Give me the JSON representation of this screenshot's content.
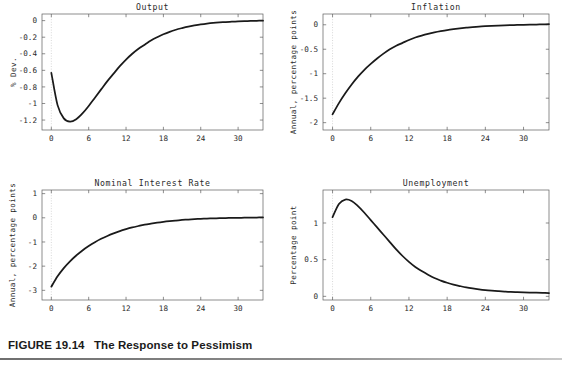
{
  "figure": {
    "caption_number": "FIGURE 19.14",
    "caption_title": "The Response to Pessimism"
  },
  "chart_data": [
    {
      "type": "line",
      "panel_id": "output",
      "title": "Output",
      "xlabel": "",
      "ylabel": "% Dev.",
      "xlim": [
        -1.5,
        34
      ],
      "ylim": [
        -1.32,
        0.08
      ],
      "xticks": [
        0,
        6,
        12,
        18,
        24,
        30
      ],
      "xtick_labels": [
        "0",
        "6",
        "12",
        "18",
        "24",
        "30"
      ],
      "yticks": [
        0,
        -0.2,
        -0.4,
        -0.6,
        -0.8,
        -1,
        -1.2
      ],
      "ytick_labels": [
        "0",
        "-0.2",
        "-0.4",
        "-0.6",
        "-0.8",
        "-1",
        "-1.2"
      ],
      "grid": false,
      "zero_marker": true,
      "x": [
        0,
        1,
        2,
        3,
        4,
        5,
        6,
        7,
        8,
        9,
        10,
        11,
        12,
        13,
        14,
        15,
        16,
        17,
        18,
        19,
        20,
        21,
        22,
        23,
        24,
        25,
        26,
        27,
        28,
        29,
        30,
        31,
        32,
        33,
        34
      ],
      "values": [
        -0.63,
        -1.02,
        -1.18,
        -1.22,
        -1.19,
        -1.12,
        -1.03,
        -0.93,
        -0.83,
        -0.73,
        -0.64,
        -0.55,
        -0.47,
        -0.4,
        -0.34,
        -0.29,
        -0.24,
        -0.2,
        -0.165,
        -0.135,
        -0.11,
        -0.09,
        -0.072,
        -0.058,
        -0.046,
        -0.036,
        -0.028,
        -0.022,
        -0.017,
        -0.013,
        -0.009,
        -0.006,
        -0.004,
        -0.002,
        0.0
      ]
    },
    {
      "type": "line",
      "panel_id": "inflation",
      "title": "Inflation",
      "xlabel": "",
      "ylabel": "Annual, percentage points",
      "xlim": [
        -1.5,
        34
      ],
      "ylim": [
        -2.15,
        0.22
      ],
      "xticks": [
        0,
        6,
        12,
        18,
        24,
        30
      ],
      "xtick_labels": [
        "0",
        "6",
        "12",
        "18",
        "24",
        "30"
      ],
      "yticks": [
        0,
        -0.5,
        -1,
        -1.5,
        -2
      ],
      "ytick_labels": [
        "0",
        "-0.5",
        "-1",
        "-1.5",
        "-2"
      ],
      "grid": false,
      "zero_marker": true,
      "x": [
        0,
        1,
        2,
        3,
        4,
        5,
        6,
        7,
        8,
        9,
        10,
        11,
        12,
        13,
        14,
        15,
        16,
        17,
        18,
        19,
        20,
        21,
        22,
        23,
        24,
        25,
        26,
        27,
        28,
        29,
        30,
        31,
        32,
        33,
        34
      ],
      "values": [
        -1.83,
        -1.6,
        -1.4,
        -1.22,
        -1.06,
        -0.92,
        -0.8,
        -0.69,
        -0.59,
        -0.5,
        -0.43,
        -0.37,
        -0.31,
        -0.26,
        -0.22,
        -0.185,
        -0.155,
        -0.13,
        -0.108,
        -0.09,
        -0.074,
        -0.06,
        -0.048,
        -0.038,
        -0.03,
        -0.023,
        -0.017,
        -0.012,
        -0.008,
        -0.004,
        -0.001,
        0.002,
        0.005,
        0.008,
        0.012
      ]
    },
    {
      "type": "line",
      "panel_id": "nominal-interest-rate",
      "title": "Nominal Interest Rate",
      "xlabel": "",
      "ylabel": "Annual, percentage points",
      "xlim": [
        -1.5,
        34
      ],
      "ylim": [
        -3.4,
        1.15
      ],
      "xticks": [
        0,
        6,
        12,
        18,
        24,
        30
      ],
      "xtick_labels": [
        "0",
        "6",
        "12",
        "18",
        "24",
        "30"
      ],
      "yticks": [
        1,
        0,
        -1,
        -2,
        -3
      ],
      "ytick_labels": [
        "1",
        "0",
        "-1",
        "-2",
        "-3"
      ],
      "grid": false,
      "zero_marker": true,
      "x": [
        0,
        1,
        2,
        3,
        4,
        5,
        6,
        7,
        8,
        9,
        10,
        11,
        12,
        13,
        14,
        15,
        16,
        17,
        18,
        19,
        20,
        21,
        22,
        23,
        24,
        25,
        26,
        27,
        28,
        29,
        30,
        31,
        32,
        33,
        34
      ],
      "values": [
        -2.85,
        -2.42,
        -2.08,
        -1.8,
        -1.56,
        -1.35,
        -1.17,
        -1.01,
        -0.87,
        -0.75,
        -0.645,
        -0.55,
        -0.47,
        -0.4,
        -0.34,
        -0.285,
        -0.24,
        -0.2,
        -0.166,
        -0.137,
        -0.112,
        -0.09,
        -0.072,
        -0.056,
        -0.043,
        -0.032,
        -0.023,
        -0.015,
        -0.009,
        -0.004,
        0.0,
        0.004,
        0.008,
        0.012,
        0.016
      ]
    },
    {
      "type": "line",
      "panel_id": "unemployment",
      "title": "Unemployment",
      "xlabel": "",
      "ylabel": "Percentage point",
      "xlim": [
        -1.5,
        34
      ],
      "ylim": [
        -0.05,
        1.45
      ],
      "xticks": [
        0,
        6,
        12,
        18,
        24,
        30
      ],
      "xtick_labels": [
        "0",
        "6",
        "12",
        "18",
        "24",
        "30"
      ],
      "yticks": [
        1,
        0.5,
        0
      ],
      "ytick_labels": [
        "1",
        "0.5",
        "0"
      ],
      "grid": false,
      "zero_marker": true,
      "x": [
        0,
        1,
        2,
        3,
        4,
        5,
        6,
        7,
        8,
        9,
        10,
        11,
        12,
        13,
        14,
        15,
        16,
        17,
        18,
        19,
        20,
        21,
        22,
        23,
        24,
        25,
        26,
        27,
        28,
        29,
        30,
        31,
        32,
        33,
        34
      ],
      "values": [
        1.08,
        1.26,
        1.32,
        1.3,
        1.23,
        1.14,
        1.04,
        0.94,
        0.84,
        0.74,
        0.64,
        0.55,
        0.47,
        0.4,
        0.345,
        0.295,
        0.25,
        0.215,
        0.185,
        0.16,
        0.14,
        0.122,
        0.108,
        0.096,
        0.086,
        0.078,
        0.071,
        0.065,
        0.06,
        0.057,
        0.054,
        0.051,
        0.049,
        0.047,
        0.045
      ]
    }
  ]
}
